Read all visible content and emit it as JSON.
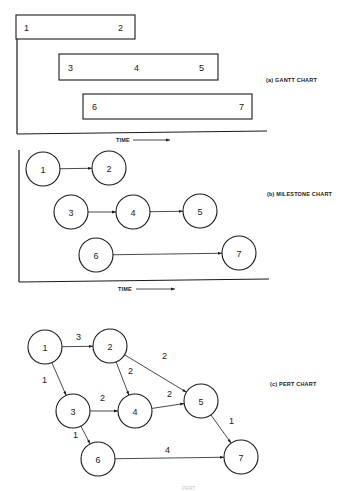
{
  "gantt": {
    "caption": "(a) GANTT CHART",
    "time_label": "TIME",
    "bars": [
      {
        "x": 16,
        "y": 15,
        "w": 119,
        "h": 24,
        "labels": [
          {
            "text": "1",
            "x": 24
          },
          {
            "text": "2",
            "x": 118
          }
        ]
      },
      {
        "x": 59,
        "y": 54,
        "w": 159,
        "h": 26,
        "labels": [
          {
            "text": "3",
            "x": 68
          },
          {
            "text": "4",
            "x": 134
          },
          {
            "text": "5",
            "x": 199
          }
        ]
      },
      {
        "x": 83,
        "y": 94,
        "w": 169,
        "h": 25,
        "labels": [
          {
            "text": "6",
            "x": 92
          },
          {
            "text": "7",
            "x": 239
          }
        ]
      }
    ]
  },
  "milestone": {
    "caption": "(b) MILESTONE CHART",
    "time_label": "TIME",
    "nodes": [
      {
        "id": "1",
        "cx": 43,
        "cy": 169
      },
      {
        "id": "2",
        "cx": 109,
        "cy": 168
      },
      {
        "id": "3",
        "cx": 71,
        "cy": 212
      },
      {
        "id": "4",
        "cx": 133,
        "cy": 212
      },
      {
        "id": "5",
        "cx": 200,
        "cy": 211
      },
      {
        "id": "6",
        "cx": 96,
        "cy": 255
      },
      {
        "id": "7",
        "cx": 239,
        "cy": 253
      }
    ],
    "edges": [
      {
        "from": "1",
        "to": "2"
      },
      {
        "from": "3",
        "to": "4"
      },
      {
        "from": "4",
        "to": "5"
      },
      {
        "from": "6",
        "to": "7"
      }
    ]
  },
  "pert": {
    "caption": "(c) PERT CHART",
    "nodes": [
      {
        "id": "1",
        "cx": 45,
        "cy": 347
      },
      {
        "id": "2",
        "cx": 110,
        "cy": 346
      },
      {
        "id": "3",
        "cx": 73,
        "cy": 411
      },
      {
        "id": "4",
        "cx": 135,
        "cy": 411
      },
      {
        "id": "5",
        "cx": 201,
        "cy": 401
      },
      {
        "id": "6",
        "cx": 98,
        "cy": 459
      },
      {
        "id": "7",
        "cx": 241,
        "cy": 457
      }
    ],
    "edges": [
      {
        "from": "1",
        "to": "2",
        "weight": "3",
        "lx": 76,
        "ly": 340
      },
      {
        "from": "1",
        "to": "3",
        "weight": "1",
        "lx": 42,
        "ly": 383
      },
      {
        "from": "2",
        "to": "4",
        "weight": "2",
        "lx": 128,
        "ly": 374
      },
      {
        "from": "2",
        "to": "5",
        "weight": "2",
        "lx": 162,
        "ly": 359
      },
      {
        "from": "3",
        "to": "4",
        "weight": "2",
        "lx": 100,
        "ly": 401
      },
      {
        "from": "4",
        "to": "5",
        "weight": "2",
        "lx": 167,
        "ly": 397
      },
      {
        "from": "3",
        "to": "6",
        "weight": "1",
        "lx": 73,
        "ly": 438
      },
      {
        "from": "5",
        "to": "7",
        "weight": "1",
        "lx": 229,
        "ly": 424
      },
      {
        "from": "6",
        "to": "7",
        "weight": "4",
        "lx": 165,
        "ly": 453
      }
    ]
  },
  "footer": {
    "faint_text": "PERT"
  }
}
